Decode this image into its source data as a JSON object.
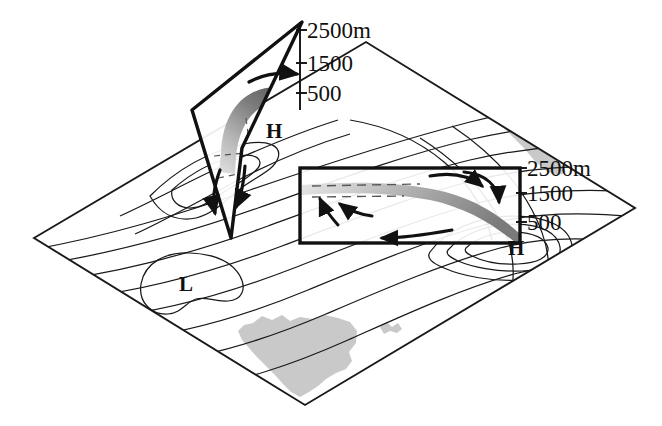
{
  "figure": {
    "background_color": "#ffffff",
    "line_color": "#1a1a1a",
    "land_color": "#c9c9c9",
    "band_color_dark": "#6e6e6e",
    "band_color_light": "#d8d8d8"
  },
  "base_plane": {
    "name": "map-plane",
    "corners": {
      "left": [
        34,
        238
      ],
      "top": [
        366,
        42
      ],
      "right": [
        635,
        208
      ],
      "bottom": [
        305,
        405
      ]
    }
  },
  "pressure_centers": [
    {
      "id": "low-center",
      "label": "L",
      "x": 186,
      "y": 283
    },
    {
      "id": "high-center-left-panel",
      "label": "H",
      "x": 274,
      "y": 130
    },
    {
      "id": "high-center-right-panel",
      "label": "H",
      "x": 516,
      "y": 247
    }
  ],
  "left_panel": {
    "name": "cross-section-left",
    "type": "tilted-parallelogram",
    "axis_labels": [
      {
        "text": "2500m",
        "x": 303,
        "y": 38,
        "tick_y": 30
      },
      {
        "text": "1500",
        "x": 303,
        "y": 71,
        "tick_y": 63
      },
      {
        "text": "500",
        "x": 303,
        "y": 101,
        "tick_y": 93
      }
    ],
    "corners": [
      [
        302,
        22
      ],
      [
        242,
        148
      ],
      [
        231,
        238
      ],
      [
        192,
        110
      ]
    ],
    "flow_band": "hooked ascending band",
    "arrows": [
      "arrow-top-right",
      "arrow-bottom-left",
      "arrow-bottom-right"
    ]
  },
  "right_panel": {
    "name": "cross-section-right",
    "type": "rectangle",
    "axis_labels": [
      {
        "text": "2500m",
        "x": 527,
        "y": 175,
        "tick_y": 168
      },
      {
        "text": "1500",
        "x": 527,
        "y": 200,
        "tick_y": 193
      },
      {
        "text": "500",
        "x": 527,
        "y": 229,
        "tick_y": 222
      }
    ],
    "rect": {
      "x": 300,
      "y": 168,
      "width": 220,
      "height": 75
    },
    "flow_band": "descending band toward lower right",
    "dashed_lines": 2,
    "arrows": [
      "arrow-down-right",
      "arrow-inner-right",
      "arrow-left-upper",
      "arrow-left-lower",
      "arrow-bottom-edge"
    ]
  },
  "contours": {
    "name": "isohypse-contours",
    "count": 14,
    "description": "smooth wave-like height contour lines across the map plane"
  },
  "land_masses": [
    {
      "id": "landmass-upper-right",
      "description": "narrow strip along upper-right edge"
    },
    {
      "id": "landmass-bottom",
      "description": "large irregular region near bottom corner"
    },
    {
      "id": "landmass-small-island",
      "description": "tiny island right of the large region"
    }
  ]
}
